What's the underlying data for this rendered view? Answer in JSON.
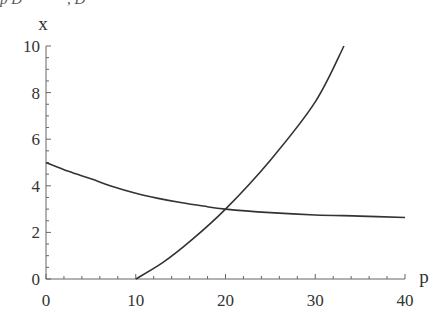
{
  "caption_fragment": "p D            , D",
  "chart_data": {
    "type": "line",
    "title": "",
    "xlabel": "p",
    "ylabel": "x",
    "xlim": [
      0,
      40
    ],
    "ylim": [
      0,
      10
    ],
    "xticks": [
      "0",
      "10",
      "20",
      "30",
      "40"
    ],
    "yticks": [
      "0",
      "2",
      "4",
      "6",
      "8",
      "10"
    ],
    "grid": false,
    "legend": "none",
    "series": [
      {
        "name": "demand",
        "points": [
          [
            0,
            5.0
          ],
          [
            2.5,
            4.62
          ],
          [
            5,
            4.3
          ],
          [
            7.5,
            3.96
          ],
          [
            10,
            3.68
          ],
          [
            12.5,
            3.46
          ],
          [
            15,
            3.28
          ],
          [
            17.5,
            3.13
          ],
          [
            20,
            3.0
          ],
          [
            25,
            2.85
          ],
          [
            30,
            2.75
          ],
          [
            35,
            2.7
          ],
          [
            40,
            2.64
          ]
        ]
      },
      {
        "name": "supply",
        "points": [
          [
            10,
            0
          ],
          [
            13,
            0.7
          ],
          [
            16,
            1.6
          ],
          [
            20,
            3.0
          ],
          [
            25,
            5.1
          ],
          [
            30,
            7.6
          ],
          [
            33.2,
            10
          ]
        ]
      }
    ],
    "annotations": [
      {
        "text": "intersection",
        "x": 20,
        "y": 3
      }
    ]
  }
}
